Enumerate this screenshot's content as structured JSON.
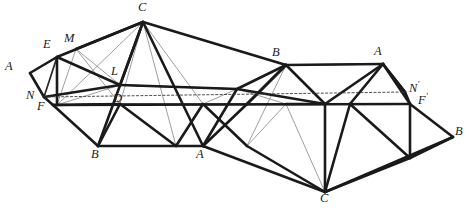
{
  "figure": {
    "background_color": "#ffffff",
    "width": 469,
    "height": 212
  },
  "style": {
    "thick_color": "#1a1a1a",
    "thick_width": 2.6,
    "medium_color": "#2b2b2b",
    "medium_width": 1.7,
    "thin_color": "#8d8d8d",
    "thin_width": 0.85,
    "dotted_color": "#3a3a3a",
    "dotted_width": 0.9,
    "dotted_dash": "2.2,2.2"
  },
  "vertices": {
    "A_left": {
      "x": 30,
      "y": 73
    },
    "E": {
      "x": 57,
      "y": 57
    },
    "M": {
      "x": 76,
      "y": 49
    },
    "C_top": {
      "x": 143,
      "y": 22
    },
    "B_top": {
      "x": 286,
      "y": 65
    },
    "A_topright": {
      "x": 383,
      "y": 64
    },
    "N_prime": {
      "x": 405,
      "y": 92
    },
    "F_prime": {
      "x": 410,
      "y": 104
    },
    "B_right": {
      "x": 453,
      "y": 137
    },
    "N": {
      "x": 44,
      "y": 97
    },
    "F": {
      "x": 53,
      "y": 105
    },
    "L": {
      "x": 120,
      "y": 85
    },
    "D": {
      "x": 118,
      "y": 104
    },
    "B_bottom": {
      "x": 98,
      "y": 146
    },
    "A_bottom": {
      "x": 203,
      "y": 146
    },
    "C_bottom": {
      "x": 325,
      "y": 192
    }
  },
  "labels": [
    {
      "name": "label-A-left",
      "text": "A",
      "prime": "",
      "x": 5,
      "y": 60
    },
    {
      "name": "label-E",
      "text": "E",
      "prime": "",
      "x": 43,
      "y": 38
    },
    {
      "name": "label-M",
      "text": "M",
      "prime": "",
      "x": 64,
      "y": 32
    },
    {
      "name": "label-C-top",
      "text": "C",
      "prime": "",
      "x": 138,
      "y": 1
    },
    {
      "name": "label-B-top",
      "text": "B",
      "prime": "",
      "x": 272,
      "y": 46
    },
    {
      "name": "label-A-topright",
      "text": "A",
      "prime": "",
      "x": 374,
      "y": 45
    },
    {
      "name": "label-N-prime",
      "text": "N",
      "prime": "'",
      "x": 409,
      "y": 80
    },
    {
      "name": "label-F-prime",
      "text": "F",
      "prime": "'",
      "x": 418,
      "y": 92
    },
    {
      "name": "label-B-right",
      "text": "B",
      "prime": "",
      "x": 455,
      "y": 125
    },
    {
      "name": "label-N",
      "text": "N",
      "prime": "",
      "x": 26,
      "y": 89
    },
    {
      "name": "label-F",
      "text": "F",
      "prime": "",
      "x": 37,
      "y": 100
    },
    {
      "name": "label-L",
      "text": "L",
      "prime": "",
      "x": 111,
      "y": 65
    },
    {
      "name": "label-D",
      "text": "D",
      "prime": "",
      "x": 113,
      "y": 92
    },
    {
      "name": "label-B-bottom",
      "text": "B",
      "prime": "",
      "x": 91,
      "y": 148
    },
    {
      "name": "label-A-bottom",
      "text": "A",
      "prime": "",
      "x": 196,
      "y": 148
    },
    {
      "name": "label-C-bottom",
      "text": "C",
      "prime": "",
      "x": 320,
      "y": 192
    }
  ],
  "edges": {
    "thick": [
      [
        30,
        73,
        57,
        57
      ],
      [
        57,
        57,
        143,
        22
      ],
      [
        143,
        22,
        286,
        65
      ],
      [
        286,
        65,
        383,
        64
      ],
      [
        383,
        64,
        405,
        92
      ],
      [
        405,
        92,
        410,
        104
      ],
      [
        410,
        104,
        453,
        137
      ],
      [
        453,
        137,
        325,
        192
      ],
      [
        325,
        192,
        203,
        146
      ],
      [
        203,
        146,
        98,
        146
      ],
      [
        98,
        146,
        53,
        105
      ],
      [
        53,
        105,
        44,
        97
      ],
      [
        44,
        97,
        30,
        73
      ],
      [
        57,
        57,
        57,
        105
      ],
      [
        57,
        57,
        120,
        85
      ],
      [
        143,
        22,
        120,
        85
      ],
      [
        143,
        22,
        203,
        146
      ],
      [
        143,
        22,
        98,
        146
      ],
      [
        76,
        49,
        143,
        22
      ],
      [
        53,
        105,
        120,
        104
      ],
      [
        120,
        104,
        98,
        146
      ],
      [
        44,
        97,
        120,
        85
      ],
      [
        120,
        85,
        237,
        89
      ],
      [
        237,
        89,
        286,
        65
      ],
      [
        237,
        89,
        203,
        146
      ],
      [
        286,
        65,
        247,
        104
      ],
      [
        247,
        104,
        203,
        146
      ],
      [
        286,
        65,
        325,
        104
      ],
      [
        325,
        104,
        286,
        104
      ],
      [
        383,
        64,
        350,
        104
      ],
      [
        383,
        64,
        410,
        104
      ],
      [
        350,
        104,
        325,
        192
      ],
      [
        405,
        92,
        383,
        64
      ],
      [
        53,
        105,
        410,
        104
      ],
      [
        237,
        89,
        325,
        104
      ],
      [
        325,
        104,
        383,
        64
      ],
      [
        325,
        104,
        325,
        192
      ],
      [
        247,
        104,
        286,
        65
      ],
      [
        120,
        104,
        176,
        146
      ],
      [
        176,
        146,
        203,
        104
      ],
      [
        203,
        104,
        247,
        146
      ],
      [
        410,
        104,
        410,
        158
      ],
      [
        410,
        158,
        453,
        137
      ],
      [
        410,
        158,
        325,
        192
      ],
      [
        350,
        104,
        410,
        158
      ],
      [
        325,
        192,
        247,
        146
      ]
    ],
    "medium": [
      [
        57,
        105,
        120,
        104
      ],
      [
        120,
        104,
        53,
        105
      ],
      [
        44,
        97,
        57,
        57
      ],
      [
        286,
        104,
        350,
        104
      ],
      [
        203,
        104,
        247,
        104
      ],
      [
        247,
        104,
        286,
        104
      ],
      [
        120,
        104,
        203,
        104
      ],
      [
        383,
        64,
        286,
        65
      ],
      [
        237,
        89,
        120,
        85
      ]
    ],
    "thin": [
      [
        57,
        57,
        76,
        49
      ],
      [
        76,
        49,
        57,
        105
      ],
      [
        76,
        49,
        120,
        104
      ],
      [
        76,
        49,
        120,
        85
      ],
      [
        57,
        57,
        44,
        97
      ],
      [
        143,
        22,
        57,
        105
      ],
      [
        120,
        85,
        98,
        146
      ],
      [
        143,
        22,
        120,
        104
      ],
      [
        176,
        146,
        143,
        22
      ],
      [
        203,
        104,
        143,
        22
      ],
      [
        286,
        65,
        247,
        146
      ],
      [
        325,
        104,
        286,
        104
      ],
      [
        350,
        104,
        286,
        104
      ],
      [
        383,
        64,
        325,
        104
      ],
      [
        410,
        158,
        350,
        104
      ],
      [
        410,
        104,
        383,
        64
      ],
      [
        325,
        192,
        286,
        104
      ],
      [
        247,
        146,
        286,
        104
      ],
      [
        203,
        146,
        247,
        104
      ],
      [
        176,
        146,
        203,
        104
      ],
      [
        98,
        146,
        120,
        104
      ],
      [
        120,
        85,
        57,
        105
      ],
      [
        237,
        89,
        203,
        104
      ],
      [
        237,
        89,
        286,
        104
      ]
    ],
    "dotted": [
      [
        44,
        97,
        405,
        92
      ]
    ]
  }
}
